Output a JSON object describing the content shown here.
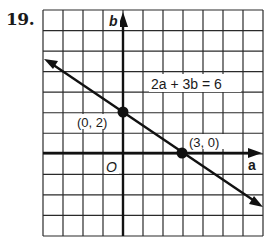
{
  "problem": {
    "number": "19."
  },
  "chart_data": {
    "type": "line",
    "title": "",
    "xlabel": "a",
    "ylabel": "b",
    "xlim": [
      -4,
      7
    ],
    "ylim": [
      -4,
      7
    ],
    "grid": true,
    "origin_label": "O",
    "series": [
      {
        "name": "2a + 3b = 6",
        "equation": "2a + 3b = 6",
        "x": [
          -4,
          0,
          3,
          7
        ],
        "values": [
          4.67,
          2,
          0,
          -2.67
        ],
        "arrows_both_ends": true
      }
    ],
    "points": [
      {
        "label": "(0, 2)",
        "x": 0,
        "y": 2
      },
      {
        "label": "(3, 0)",
        "x": 3,
        "y": 0
      }
    ],
    "annotations": [
      {
        "text": "2a + 3b = 6",
        "x": 2.5,
        "y": 4.3
      }
    ]
  },
  "labels": {
    "equation": "2a + 3b = 6",
    "point1": "(0, 2)",
    "point2": "(3, 0)",
    "origin": "O",
    "x_axis": "a",
    "y_axis": "b"
  }
}
